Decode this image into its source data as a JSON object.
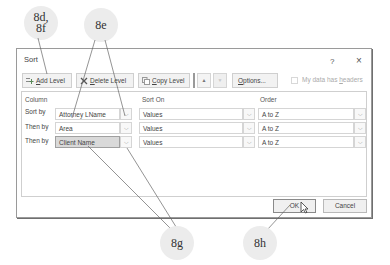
{
  "callouts": {
    "c1": "8d,\n8f",
    "c1_line1": "8d,",
    "c1_line2": "8f",
    "c2": "8e",
    "c3": "8g",
    "c4": "8h"
  },
  "dialog": {
    "title": "Sort",
    "help_label": "?",
    "close_label": "×",
    "toolbar": {
      "add_level": {
        "accel": "A",
        "rest": "dd Level"
      },
      "delete_level": {
        "accel": "D",
        "rest": "elete Level"
      },
      "copy_level": {
        "accel": "C",
        "rest": "opy Level"
      },
      "move_up": "▲",
      "move_down": "▼",
      "options": {
        "accel": "O",
        "rest": "ptions..."
      },
      "headers_checkbox": {
        "label_pre": "My data has ",
        "accel": "h",
        "label_post": "eaders",
        "checked": false
      }
    },
    "headers": {
      "column": "Column",
      "sort_on": "Sort On",
      "order": "Order"
    },
    "rows": [
      {
        "label": "Sort by",
        "column": "Attorney LName",
        "sort_on": "Values",
        "order": "A to Z"
      },
      {
        "label": "Then by",
        "column": "Area",
        "sort_on": "Values",
        "order": "A to Z"
      },
      {
        "label": "Then by",
        "column": "Client Name",
        "sort_on": "Values",
        "order": "A to Z",
        "selected": true
      }
    ],
    "dropdown_glyph": "⌵",
    "ok_label": "OK",
    "cancel_label": "Cancel"
  }
}
